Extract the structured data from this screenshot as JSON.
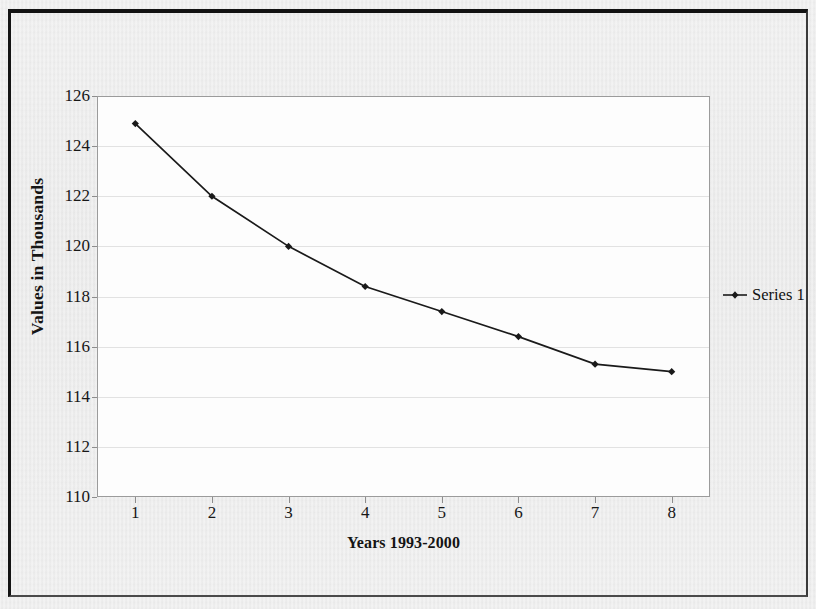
{
  "figure": {
    "background_color": "#e9e9e9",
    "plot_background_color": "#fdfdfd",
    "border_color": "#141414",
    "series_color": "#1a1a1a",
    "gridline_color": "#e2e2e2"
  },
  "legend": {
    "entries": [
      {
        "label": "Series 1",
        "marker": "diamond-line-marker",
        "color": "#1a1a1a"
      }
    ],
    "position": "right"
  },
  "chart_data": {
    "type": "line",
    "title": "",
    "xlabel": "Years 1993-2000",
    "ylabel": "Values in Thousands",
    "categories": [
      "1",
      "2",
      "3",
      "4",
      "5",
      "6",
      "7",
      "8"
    ],
    "series": [
      {
        "name": "Series 1",
        "values": [
          124.9,
          122.0,
          120.0,
          118.4,
          117.4,
          116.4,
          115.3,
          115.0
        ]
      }
    ],
    "ylim": [
      110,
      126
    ],
    "yticks": [
      110,
      112,
      114,
      116,
      118,
      120,
      122,
      124,
      126
    ],
    "ytick_labels": [
      "110",
      "112",
      "114",
      "116",
      "118",
      "120",
      "122",
      "124",
      "126"
    ],
    "xtick_labels": [
      "1",
      "2",
      "3",
      "4",
      "5",
      "6",
      "7",
      "8"
    ],
    "grid": "horizontal",
    "legend_position": "right",
    "marker": "diamond"
  }
}
